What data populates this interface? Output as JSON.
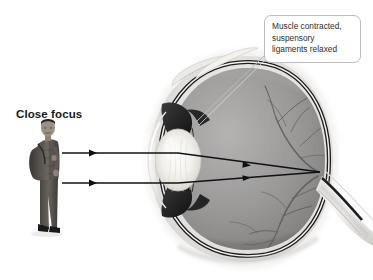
{
  "figure": {
    "kind": "anatomical-illustration",
    "background_color": "#ffffff"
  },
  "labels": {
    "close_focus": "Close focus"
  },
  "callout": {
    "lines": [
      "Muscle contracted,",
      "suspensory",
      "ligaments relaxed"
    ],
    "line1": "Muscle contracted,",
    "line2": "suspensory",
    "line3": "ligaments relaxed",
    "border_color": "#b9bcc0",
    "text_color": "#2a2c30"
  },
  "light_rays": {
    "color": "#101114",
    "count": 2,
    "upper_ray": {
      "start_x": 62,
      "start_y": 153,
      "converge_x": 320,
      "converge_y": 172
    },
    "lower_ray": {
      "start_x": 62,
      "start_y": 183,
      "converge_x": 320,
      "converge_y": 172
    },
    "arrowheads": [
      {
        "x": 95,
        "y": 153
      },
      {
        "x": 95,
        "y": 183
      },
      {
        "x": 250,
        "y": 165
      },
      {
        "x": 250,
        "y": 178
      }
    ]
  },
  "eye": {
    "center_x": 245,
    "center_y": 160,
    "sclera_color": "#e9e8e6",
    "retina_color": "#8e8d8b",
    "choroid_color": "#1d1d1d",
    "lens_color": "#f2f1ee",
    "ciliary_color": "#2b2b2b",
    "vessel_color": "#636261"
  },
  "person": {
    "description": "standing person with backpack",
    "skin_color": "#8d8175",
    "clothing_color": "#595550",
    "hair_color": "#1f1d1c"
  }
}
